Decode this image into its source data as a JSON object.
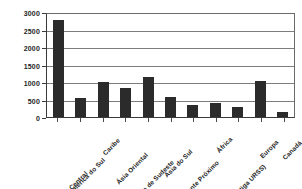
{
  "chart_data": {
    "type": "bar",
    "title": "",
    "subtitle": "",
    "xlabel": "",
    "ylabel": "",
    "ylim": [
      0,
      3000
    ],
    "ytick_labels": [
      "3000",
      "2500",
      "2000",
      "1500",
      "1000",
      "500",
      "0"
    ],
    "yticks": [
      3000,
      2500,
      2000,
      1500,
      1000,
      500,
      0
    ],
    "grid": true,
    "legend": false,
    "legend_position": "none",
    "bar_color": "#2b2b2b",
    "gridline_color": "#7d7d7d",
    "axis_color": "#3a3a3a",
    "categories": [
      "México e Am. Central",
      "América do Sul",
      "Caribe",
      "Ásia Oriental",
      "Ásia de Sudeste",
      "Ásia do Sul",
      "Oriente Próximo",
      "África",
      "CEI (antiga URSS)",
      "Europa",
      "Canadá"
    ],
    "values": [
      2760,
      530,
      1000,
      830,
      1150,
      580,
      350,
      400,
      300,
      1030,
      150
    ]
  }
}
